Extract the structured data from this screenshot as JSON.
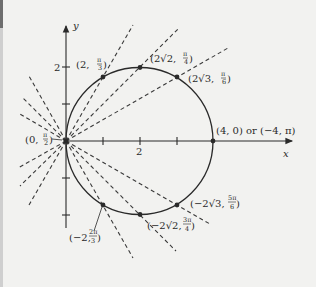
{
  "figure": {
    "axes": {
      "x_label": "x",
      "y_label": "y",
      "x_tick_label": "2",
      "y_tick_label": "2"
    },
    "circle": {
      "equation": "r = 4 cos θ",
      "center": [
        2,
        0
      ],
      "radius": 2
    },
    "points": [
      {
        "id": "p1",
        "r": "2",
        "theta_num": "π",
        "theta_den": "3",
        "label_prefix": "(2, ",
        "x": 1,
        "y": 1.732
      },
      {
        "id": "p2",
        "r": "2√2",
        "theta_num": "π",
        "theta_den": "4",
        "label_prefix": "(2√2, ",
        "x": 2,
        "y": 2
      },
      {
        "id": "p3",
        "r": "2√3",
        "theta_num": "π",
        "theta_den": "6",
        "label_prefix": "(2√3, ",
        "x": 3,
        "y": 1.732
      },
      {
        "id": "p4",
        "label": "(4, 0) or (−4, π)",
        "x": 4,
        "y": 0
      },
      {
        "id": "p5",
        "r": "−2√3",
        "theta_num": "5π",
        "theta_den": "6",
        "label_prefix": "(−2√3, ",
        "x": 3,
        "y": -1.732
      },
      {
        "id": "p6",
        "r": "−2√2",
        "theta_num": "3π",
        "theta_den": "4",
        "label_prefix": "(−2√2, ",
        "x": 2,
        "y": -2
      },
      {
        "id": "p7",
        "r": "−2",
        "theta_num": "2π",
        "theta_den": "3",
        "label_prefix": "(−2, ",
        "x": 1,
        "y": -1.732
      },
      {
        "id": "p0",
        "r": "0",
        "theta_num": "π",
        "theta_den": "2",
        "label_prefix": "(0, ",
        "x": 0,
        "y": 0
      }
    ],
    "suffix": ")",
    "colors": {
      "background": "#f2f2f0",
      "ink": "#2a2a2a",
      "dashed": "#3a3a3a"
    }
  }
}
